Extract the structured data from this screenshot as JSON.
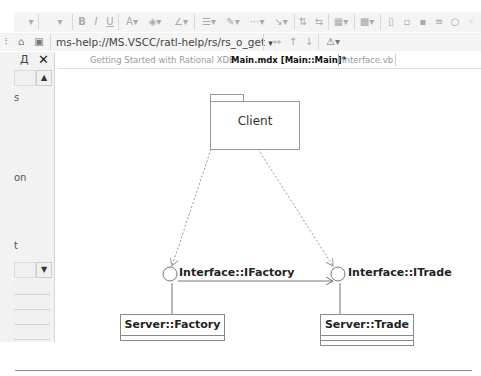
{
  "toolbar_top": {
    "items": [
      "font-dropdown",
      "size-dropdown",
      "bold",
      "italic",
      "underline",
      "font-color",
      "fill-color",
      "line-color",
      "align",
      "line-style",
      "connector",
      "arrange",
      "layout",
      "group",
      "zoom-fit",
      "show-attrs",
      "show-ops",
      "show-sigs",
      "show-stereo",
      "show-vis"
    ],
    "labels": {
      "bold": "B",
      "italic": "I",
      "underline": "U",
      "font_color": "A"
    }
  },
  "address_bar": {
    "url": "ms-help://MS.VSCC/ratl-help/rs/rs_o_get",
    "dropdown_glyph": "▾"
  },
  "left_panel": {
    "pin_glyph": "Д",
    "close_glyph": "✕",
    "partial_labels": [
      "s",
      "on",
      "t"
    ]
  },
  "tabs": [
    {
      "label": "Getting Started with Rational XDE",
      "active": false
    },
    {
      "label": "Main.mdx [Main::Main]*",
      "active": true
    },
    {
      "label": "Interface.vb",
      "active": false
    }
  ],
  "diagram": {
    "package": {
      "name": "Client"
    },
    "interfaces": [
      {
        "name": "Interface::IFactory"
      },
      {
        "name": "Interface::ITrade"
      }
    ],
    "classes": [
      {
        "name": "Server::Factory"
      },
      {
        "name": "Server::Trade"
      }
    ]
  }
}
